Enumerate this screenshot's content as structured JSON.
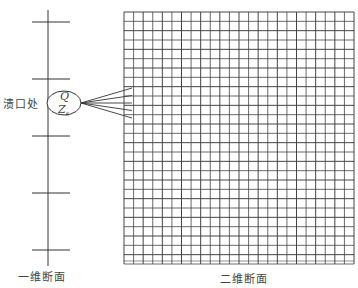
{
  "diagram": {
    "labels": {
      "breach": "溃口处",
      "one_d_section": "一维断面",
      "two_d_section": "二维断面"
    },
    "breach_node": {
      "flow_symbol": "Q",
      "level_symbol": "Z",
      "level_subscript": "s"
    },
    "one_d_channel": {
      "cross_section_count": 5
    },
    "two_d_grid": {
      "columns": 24,
      "rows": 27
    },
    "coupling_links": 5,
    "colors": {
      "line": "#333333",
      "grid_line": "#444444",
      "text": "#444444",
      "background": "#ffffff"
    }
  }
}
